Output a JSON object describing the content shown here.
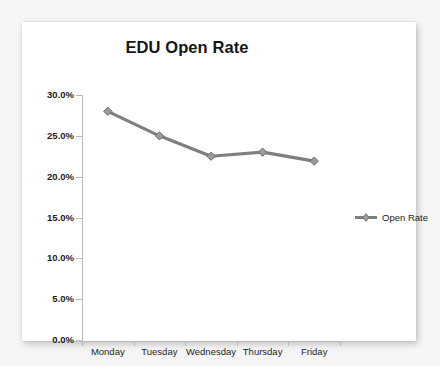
{
  "card": {
    "background_color": "#ffffff",
    "page_background_color": "#f6f6f6"
  },
  "chart_data": {
    "type": "line",
    "title": "EDU Open Rate",
    "xlabel": "",
    "ylabel": "",
    "categories": [
      "Monday",
      "Tuesday",
      "Wednesday",
      "Thursday",
      "Friday"
    ],
    "series": [
      {
        "name": "Open Rate",
        "values": [
          28.0,
          25.0,
          22.5,
          23.0,
          21.9
        ],
        "color": "#7f7f7f",
        "marker": "diamond"
      }
    ],
    "ylim": [
      0,
      30
    ],
    "ytick_values": [
      0,
      5,
      10,
      15,
      20,
      25,
      30
    ],
    "ytick_labels": [
      "0.0%",
      "5.0%",
      "10.0%",
      "15.0%",
      "20.0%",
      "25.0%",
      "30.0%"
    ],
    "grid": false,
    "legend_position": "right",
    "legend_entries": [
      "Open Rate"
    ],
    "axis_color": "#b9b9b9",
    "text_color": "#1d1d1d"
  }
}
